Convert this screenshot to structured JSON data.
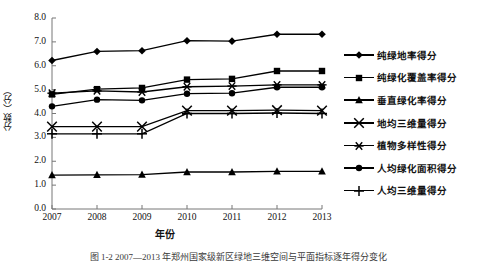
{
  "figure": {
    "caption": "图 1-2  2007—2013 年郑州国家级新区绿地三维空间与平面指标逐年得分变化"
  },
  "axes": {
    "y_label": "分数（分）",
    "x_label": "年份",
    "y_ticks": [
      "0.0",
      "1.0",
      "2.0",
      "3.0",
      "4.0",
      "5.0",
      "6.0",
      "7.0",
      "8.0"
    ],
    "x_ticks": [
      "2007",
      "2008",
      "2009",
      "2010",
      "2011",
      "2012",
      "2013"
    ]
  },
  "legend": {
    "items": [
      {
        "label": "纯绿地率得分",
        "marker": "diamond",
        "glyph": "◆"
      },
      {
        "label": "纯绿化覆盖率得分",
        "marker": "square",
        "glyph": "■"
      },
      {
        "label": "垂直绿化率得分",
        "marker": "triangle",
        "glyph": "▲"
      },
      {
        "label": "地均三维量得分",
        "marker": "cross-x",
        "glyph": "✕"
      },
      {
        "label": "植物多样性得分",
        "marker": "asterisk",
        "glyph": "✳"
      },
      {
        "label": "人均绿化面积得分",
        "marker": "circle",
        "glyph": "●"
      },
      {
        "label": "人均三维量得分",
        "marker": "plus",
        "glyph": "✚"
      }
    ]
  },
  "chart_data": {
    "type": "line",
    "title": "",
    "xlabel": "年份",
    "ylabel": "分数（分）",
    "categories": [
      "2007",
      "2008",
      "2009",
      "2010",
      "2011",
      "2012",
      "2013"
    ],
    "x": [
      2007,
      2008,
      2009,
      2010,
      2011,
      2012,
      2013
    ],
    "ylim": [
      0.0,
      8.0
    ],
    "ytick_step": 1.0,
    "grid": false,
    "legend_position": "right",
    "series": [
      {
        "name": "纯绿地率得分",
        "marker": "diamond",
        "values": [
          6.22,
          6.6,
          6.63,
          7.05,
          7.03,
          7.32,
          7.32
        ]
      },
      {
        "name": "纯绿化覆盖率得分",
        "marker": "square",
        "values": [
          4.8,
          5.02,
          5.07,
          5.42,
          5.45,
          5.78,
          5.78
        ]
      },
      {
        "name": "垂直绿化率得分",
        "marker": "triangle",
        "values": [
          1.42,
          1.43,
          1.44,
          1.55,
          1.55,
          1.58,
          1.58
        ]
      },
      {
        "name": "地均三维量得分",
        "marker": "cross-x",
        "values": [
          3.45,
          3.45,
          3.45,
          4.12,
          4.12,
          4.14,
          4.12
        ]
      },
      {
        "name": "植物多样性得分",
        "marker": "asterisk",
        "values": [
          4.85,
          4.95,
          4.9,
          5.12,
          5.15,
          5.2,
          5.2
        ]
      },
      {
        "name": "人均绿化面积得分",
        "marker": "circle",
        "values": [
          4.3,
          4.58,
          4.55,
          4.83,
          4.85,
          5.1,
          5.1
        ]
      },
      {
        "name": "人均三维量得分",
        "marker": "plus",
        "values": [
          3.15,
          3.15,
          3.15,
          4.0,
          4.0,
          4.02,
          4.0
        ]
      }
    ]
  },
  "plot_geometry": {
    "left": 52,
    "right": 322,
    "top": 18,
    "bottom": 209
  }
}
